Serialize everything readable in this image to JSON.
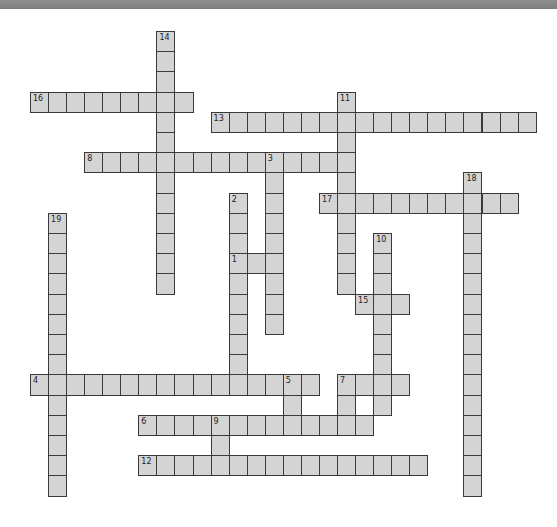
{
  "puzzle": {
    "layout": {
      "origin_x": 30,
      "origin_y": 31,
      "cell_width": 18.06,
      "cell_height": 20.2
    },
    "colors": {
      "cell_fill": "#d4d4d4",
      "cell_border": "#3a3a3a",
      "top_bar": "#858585",
      "background": "#ffffff"
    },
    "entries": [
      {
        "number": "1",
        "direction": "across",
        "row": 11,
        "col": 11,
        "length": 3
      },
      {
        "number": "2",
        "direction": "down",
        "row": 8,
        "col": 11,
        "length": 10
      },
      {
        "number": "3",
        "direction": "down",
        "row": 6,
        "col": 13,
        "length": 9
      },
      {
        "number": "4",
        "direction": "across",
        "row": 17,
        "col": 0,
        "length": 16
      },
      {
        "number": "5",
        "direction": "down",
        "row": 17,
        "col": 14,
        "length": 3
      },
      {
        "number": "6",
        "direction": "across",
        "row": 19,
        "col": 6,
        "length": 13
      },
      {
        "number": "7",
        "direction": "across",
        "row": 17,
        "col": 17,
        "length": 4
      },
      {
        "number": "7",
        "direction": "down",
        "row": 17,
        "col": 17,
        "length": 3
      },
      {
        "number": "8",
        "direction": "across",
        "row": 6,
        "col": 3,
        "length": 15
      },
      {
        "number": "9",
        "direction": "down",
        "row": 19,
        "col": 10,
        "length": 3
      },
      {
        "number": "10",
        "direction": "down",
        "row": 10,
        "col": 19,
        "length": 9
      },
      {
        "number": "11",
        "direction": "down",
        "row": 3,
        "col": 17,
        "length": 10
      },
      {
        "number": "12",
        "direction": "across",
        "row": 21,
        "col": 6,
        "length": 16
      },
      {
        "number": "13",
        "direction": "across",
        "row": 4,
        "col": 10,
        "length": 18
      },
      {
        "number": "14",
        "direction": "down",
        "row": 0,
        "col": 7,
        "length": 13
      },
      {
        "number": "15",
        "direction": "across",
        "row": 13,
        "col": 18,
        "length": 3
      },
      {
        "number": "16",
        "direction": "across",
        "row": 3,
        "col": 0,
        "length": 9
      },
      {
        "number": "17",
        "direction": "across",
        "row": 8,
        "col": 16,
        "length": 11
      },
      {
        "number": "18",
        "direction": "down",
        "row": 7,
        "col": 24,
        "length": 16
      },
      {
        "number": "19",
        "direction": "down",
        "row": 9,
        "col": 1,
        "length": 14
      }
    ]
  }
}
